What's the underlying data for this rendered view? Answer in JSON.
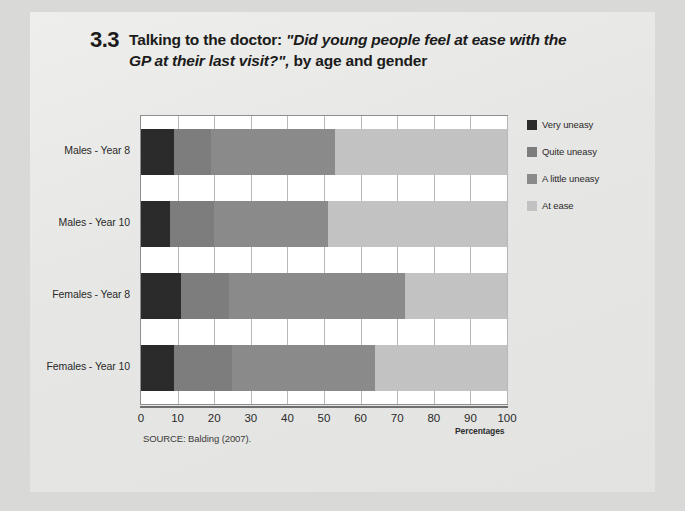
{
  "figure": {
    "number": "3.3",
    "title_line1_pre": "Talking to the doctor: ",
    "title_quote": "\"Did young people feel at ease with the GP at their last visit?\",",
    "title_post": " by age and gender",
    "source": "SOURCE: Balding (2007).",
    "xaxis_title": "Percentages"
  },
  "legend": {
    "items": [
      {
        "label": "Very uneasy",
        "color": "#2b2b2b"
      },
      {
        "label": "Quite uneasy",
        "color": "#7d7d7d"
      },
      {
        "label": "A little uneasy",
        "color": "#8a8a8a"
      },
      {
        "label": "At ease",
        "color": "#c2c2c2"
      }
    ]
  },
  "chart_data": {
    "type": "bar",
    "orientation": "horizontal",
    "stacked": true,
    "normalized": true,
    "title": "3.3 Talking to the doctor: \"Did young people feel at ease with the GP at their last visit?\", by age and gender",
    "xlabel": "Percentages",
    "ylabel": "",
    "xlim": [
      0,
      100
    ],
    "xticks": [
      0,
      10,
      20,
      30,
      40,
      50,
      60,
      70,
      80,
      90,
      100
    ],
    "grid": true,
    "legend_position": "right",
    "categories": [
      "Males - Year 8",
      "Males - Year 10",
      "Females - Year 8",
      "Females - Year 10"
    ],
    "series": [
      {
        "name": "Very uneasy",
        "color": "#2b2b2b",
        "values": [
          9,
          8,
          11,
          9
        ]
      },
      {
        "name": "Quite uneasy",
        "color": "#7d7d7d",
        "values": [
          10,
          12,
          13,
          16
        ]
      },
      {
        "name": "A little uneasy",
        "color": "#8a8a8a",
        "values": [
          34,
          31,
          48,
          39
        ]
      },
      {
        "name": "At ease",
        "color": "#c2c2c2",
        "values": [
          47,
          49,
          28,
          36
        ]
      }
    ]
  }
}
